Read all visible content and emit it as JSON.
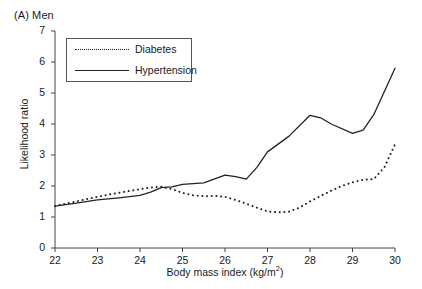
{
  "panel": {
    "label": "(A) Men"
  },
  "chart_data": {
    "type": "line",
    "title": "(A) Men",
    "xlabel": "Body mass index (kg/m2)",
    "xlabel_base": "Body mass index (kg/m",
    "xlabel_sup": "2",
    "xlabel_tail": ")",
    "ylabel": "Likelihood ratio",
    "xlim": [
      22,
      30
    ],
    "ylim": [
      0,
      7
    ],
    "xticks": [
      22,
      23,
      24,
      25,
      26,
      27,
      28,
      29,
      30
    ],
    "yticks": [
      0,
      1,
      2,
      3,
      4,
      5,
      6,
      7
    ],
    "xtick_labels": [
      "22",
      "23",
      "24",
      "25",
      "26",
      "27",
      "28",
      "29",
      "30"
    ],
    "ytick_labels": [
      "0",
      "1",
      "2",
      "3",
      "4",
      "5",
      "6",
      "7"
    ],
    "grid": false,
    "legend_position": "upper-left-inside",
    "line_color": "#222222",
    "series": [
      {
        "name": "Diabetes",
        "style": "dotted",
        "x": [
          22.0,
          22.25,
          22.5,
          22.75,
          23.0,
          23.25,
          23.5,
          23.75,
          24.0,
          24.25,
          24.5,
          24.75,
          25.0,
          25.25,
          25.5,
          25.75,
          26.0,
          26.25,
          26.5,
          26.75,
          27.0,
          27.25,
          27.5,
          27.75,
          28.0,
          28.25,
          28.5,
          28.75,
          29.0,
          29.25,
          29.5,
          29.75,
          30.0
        ],
        "y": [
          1.35,
          1.43,
          1.5,
          1.58,
          1.65,
          1.72,
          1.78,
          1.84,
          1.9,
          1.95,
          1.98,
          1.9,
          1.78,
          1.7,
          1.67,
          1.68,
          1.65,
          1.55,
          1.43,
          1.3,
          1.18,
          1.15,
          1.17,
          1.3,
          1.5,
          1.68,
          1.85,
          2.0,
          2.12,
          2.2,
          2.22,
          2.6,
          3.35
        ]
      },
      {
        "name": "Hypertension",
        "style": "solid",
        "x": [
          22.0,
          22.5,
          23.0,
          23.5,
          24.0,
          24.25,
          24.5,
          24.75,
          25.0,
          25.5,
          26.0,
          26.25,
          26.5,
          26.75,
          27.0,
          27.5,
          28.0,
          28.25,
          28.5,
          29.0,
          29.25,
          29.5,
          30.0
        ],
        "y": [
          1.35,
          1.45,
          1.55,
          1.62,
          1.7,
          1.8,
          1.95,
          1.97,
          2.05,
          2.1,
          2.35,
          2.3,
          2.22,
          2.6,
          3.1,
          3.6,
          4.28,
          4.2,
          4.0,
          3.7,
          3.8,
          4.3,
          5.8
        ]
      }
    ]
  },
  "legend": {
    "items": [
      {
        "label": "Diabetes",
        "style": "dotted"
      },
      {
        "label": "Hypertension",
        "style": "solid"
      }
    ]
  }
}
